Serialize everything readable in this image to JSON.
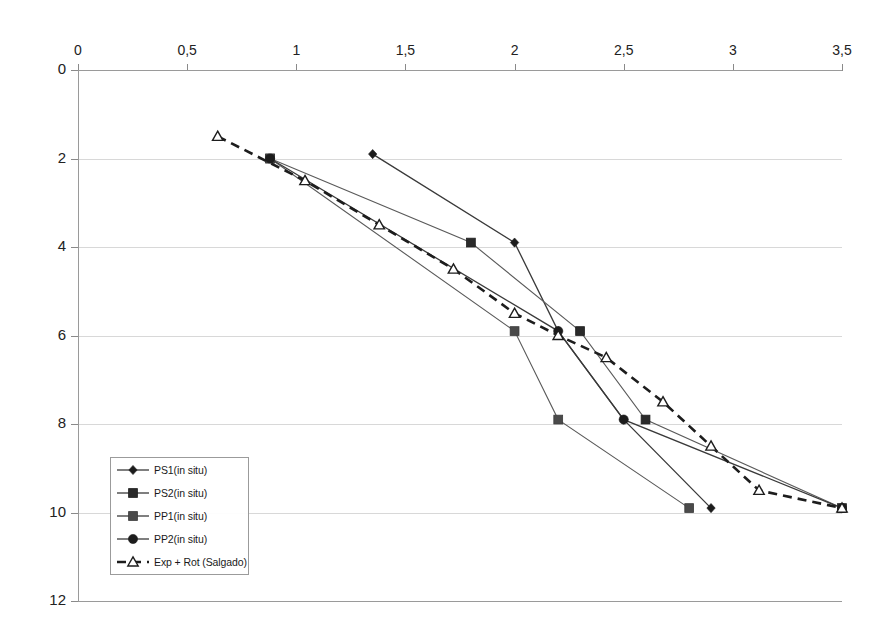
{
  "chart_data": {
    "type": "line",
    "title": "qc (MPa)",
    "title_main": "q",
    "title_sub": "c",
    "title_tail": " (MPa)",
    "xlabel": "qc (MPa)",
    "ylabel": "Depth (m)",
    "xlim": [
      0,
      3.5
    ],
    "ylim": [
      0,
      12
    ],
    "y_inverted": true,
    "grid": "horizontal",
    "legend_position": "lower-left-inside",
    "xticks": [
      "0",
      "0,5",
      "1",
      "1,5",
      "2",
      "2,5",
      "3",
      "3,5"
    ],
    "xtick_values": [
      0,
      0.5,
      1,
      1.5,
      2,
      2.5,
      3,
      3.5
    ],
    "yticks": [
      "0",
      "2",
      "4",
      "6",
      "8",
      "10",
      "12"
    ],
    "ytick_values": [
      0,
      2,
      4,
      6,
      8,
      10,
      12
    ],
    "series": [
      {
        "name": "PS1(in situ)",
        "marker": "diamond",
        "style": "solid",
        "x": [
          1.35,
          2.0,
          2.2,
          2.5,
          2.9
        ],
        "y": [
          1.9,
          3.9,
          5.9,
          7.9,
          9.9
        ]
      },
      {
        "name": "PS2(in situ)",
        "marker": "square",
        "style": "solid",
        "x": [
          0.88,
          1.8,
          2.3,
          2.6,
          3.5
        ],
        "y": [
          2.0,
          3.9,
          5.9,
          7.9,
          9.9
        ]
      },
      {
        "name": "PP1(in situ)",
        "marker": "square",
        "style": "solid",
        "x": [
          0.88,
          2.0,
          2.2,
          2.8
        ],
        "y": [
          2.0,
          5.9,
          7.9,
          9.9
        ]
      },
      {
        "name": "PP2(in situ)",
        "marker": "circle",
        "style": "solid",
        "x": [
          0.88,
          2.2,
          2.5,
          3.5
        ],
        "y": [
          2.0,
          5.9,
          7.9,
          9.9
        ]
      },
      {
        "name": "Exp + Rot (Salgado)",
        "marker": "triangle-open",
        "style": "dashed",
        "x": [
          0.64,
          1.04,
          1.38,
          1.72,
          2.0,
          2.2,
          2.42,
          2.68,
          2.9,
          3.12,
          3.5
        ],
        "y": [
          1.5,
          2.5,
          3.5,
          4.5,
          5.5,
          6.0,
          6.5,
          7.5,
          8.5,
          9.5,
          9.9
        ]
      }
    ]
  },
  "legend": {
    "items": [
      {
        "label": "PS1(in situ)",
        "marker": "diamond",
        "style": "solid"
      },
      {
        "label": "PS2(in situ)",
        "marker": "square",
        "style": "solid"
      },
      {
        "label": "PP1(in situ)",
        "marker": "square",
        "style": "solid"
      },
      {
        "label": "PP2(in situ)",
        "marker": "circle",
        "style": "solid"
      },
      {
        "label": "Exp + Rot (Salgado)",
        "marker": "triangle-open",
        "style": "dashed"
      }
    ]
  },
  "caption": ""
}
